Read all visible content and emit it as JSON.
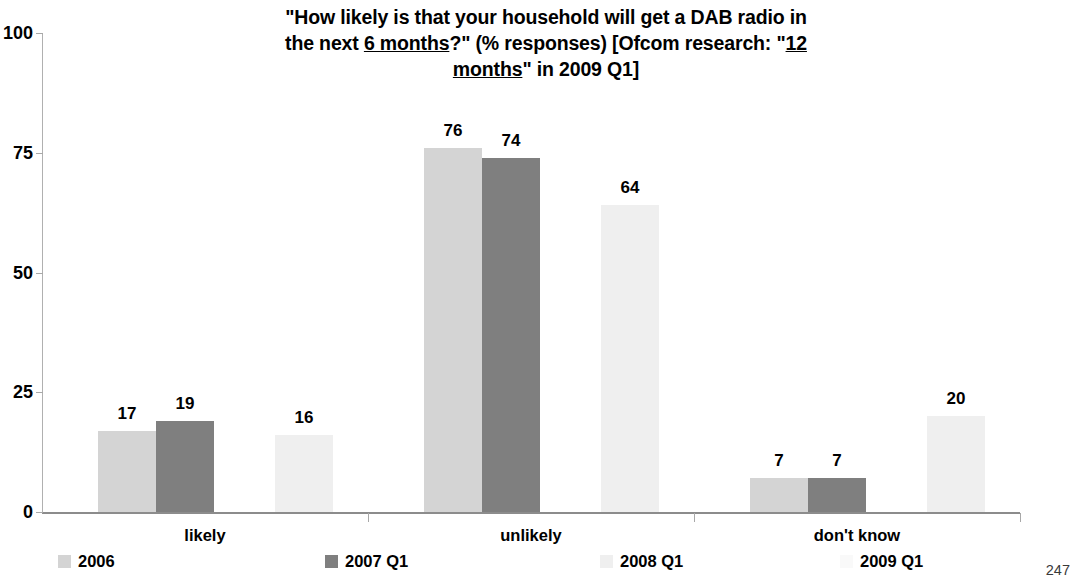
{
  "page_number": "247",
  "title": {
    "line1_pre": "\"How likely is that your household will get a DAB radio in",
    "line2_pre": "the next ",
    "line2_underline": "6 months",
    "line2_post": "?\" (% responses) [Ofcom research: \"",
    "line2_underline2": "12",
    "line3_underline": "months",
    "line3_post": "\" in 2009 Q1]",
    "full": "\"How likely is that your household will get a DAB radio in the next 6 months?\" (% responses) [Ofcom research: \"12 months\" in 2009 Q1]"
  },
  "axis": {
    "y_ticks": [
      "0",
      "25",
      "50",
      "75",
      "100"
    ],
    "y_values": [
      0,
      25,
      50,
      75,
      100
    ],
    "y_min": 0,
    "y_max": 100
  },
  "legend": [
    {
      "label": "2006",
      "color": "#d4d4d4"
    },
    {
      "label": "2007 Q1",
      "color": "#7f7f7f"
    },
    {
      "label": "2008 Q1",
      "color": "#efefef"
    },
    {
      "label": "2009 Q1",
      "color": "#f9f9f9"
    }
  ],
  "categories": [
    "likely",
    "unlikely",
    "don't know"
  ],
  "bar_labels": {
    "likely": [
      "17",
      "19",
      "16",
      ""
    ],
    "unlikely": [
      "76",
      "74",
      "64",
      ""
    ],
    "dont_know": [
      "7",
      "7",
      "20",
      ""
    ]
  },
  "chart_data": {
    "type": "bar",
    "title": "\"How likely is that your household will get a DAB radio in the next 6 months?\" (% responses) [Ofcom research: \"12 months\" in 2009 Q1]",
    "xlabel": "",
    "ylabel": "",
    "ylim": [
      0,
      100
    ],
    "yticks": [
      0,
      25,
      50,
      75,
      100
    ],
    "grid": false,
    "legend_position": "bottom",
    "categories": [
      "likely",
      "unlikely",
      "don't know"
    ],
    "series": [
      {
        "name": "2006",
        "color": "#d4d4d4",
        "values": [
          17,
          19,
          16
        ],
        "note": "plotted as first bar in each group"
      },
      {
        "name": "2007 Q1",
        "color": "#7f7f7f",
        "values": [
          19,
          74,
          7
        ]
      },
      {
        "name": "2008 Q1",
        "color": "#efefef",
        "values": [
          16,
          64,
          20
        ]
      },
      {
        "name": "2009 Q1",
        "color": "#f9f9f9",
        "values": [
          null,
          null,
          null
        ]
      }
    ],
    "series_by_group": {
      "likely": {
        "2006": 17,
        "2007 Q1": 19,
        "2008 Q1": 16,
        "2009 Q1": null
      },
      "unlikely": {
        "2006": 76,
        "2007 Q1": 74,
        "2008 Q1": 64,
        "2009 Q1": null
      },
      "don't know": {
        "2006": 7,
        "2007 Q1": 7,
        "2008 Q1": 20,
        "2009 Q1": null
      }
    },
    "data_labels": [
      [
        17,
        19,
        16,
        null
      ],
      [
        76,
        74,
        64,
        null
      ],
      [
        7,
        7,
        20,
        null
      ]
    ]
  }
}
